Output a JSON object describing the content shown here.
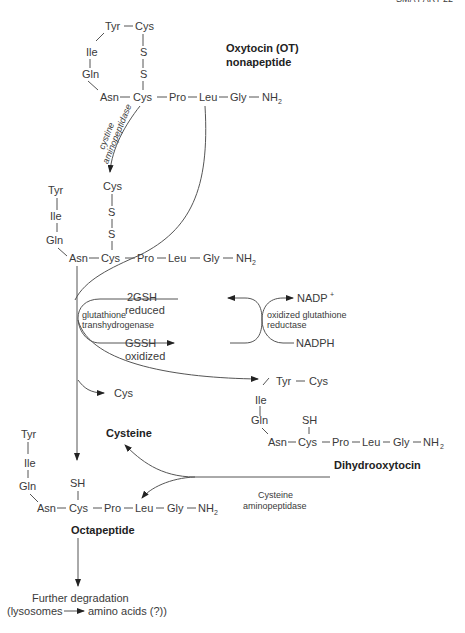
{
  "header": {
    "running_title": "SMA PART 22"
  },
  "oxytocin": {
    "title_line1": "Oxytocin (OT)",
    "title_line2": "nonapeptide",
    "ring": [
      "Tyr",
      "Cys",
      "Ile",
      "S",
      "Gln",
      "S"
    ],
    "chain": [
      "Asn",
      "Cys",
      "Pro",
      "Leu",
      "Gly",
      "NH",
      "2"
    ]
  },
  "enzyme_cystine": {
    "line1": "cystine",
    "line2": "aminopeptidase"
  },
  "intermediate": {
    "branch": [
      "Tyr",
      "Ile",
      "Gln"
    ],
    "bridge": [
      "Cys",
      "S",
      "S"
    ],
    "chain": [
      "Asn",
      "Cys",
      "Pro",
      "Leu",
      "Gly",
      "NH",
      "2"
    ]
  },
  "glutathione": {
    "enzyme_line1": "glutathione",
    "enzyme_line2": "transhydrogenase",
    "reduced_line1": "2GSH",
    "reduced_line2": "reduced",
    "oxidized_line1": "GSSH",
    "oxidized_line2": "oxidized",
    "reductase_line1": "oxidized glutathione",
    "reductase_line2": "reductase",
    "nadp": "NADP",
    "nadp_sup": "+",
    "nadph": "NADPH"
  },
  "released_cys": "Cys",
  "dihydro": {
    "ring": [
      "Tyr",
      "Cys",
      "Ile",
      "Gln",
      "SH"
    ],
    "chain": [
      "Asn",
      "Cys",
      "Pro",
      "Leu",
      "Gly",
      "NH",
      "2"
    ],
    "title": "Dihydrooxytocin"
  },
  "cysteine_label": "Cysteine",
  "enzyme_cysteine": {
    "line1": "Cysteine",
    "line2": "aminopeptidase"
  },
  "octapeptide": {
    "branch": [
      "Tyr",
      "Ile",
      "Gln",
      "SH"
    ],
    "chain": [
      "Asn",
      "Cys",
      "Pro",
      "Leu",
      "Gly",
      "NH",
      "2"
    ],
    "title": "Octapeptide"
  },
  "degradation": {
    "line1": "Further degradation",
    "line2_left": "(lysosomes",
    "line2_right": "amino acids (?))"
  }
}
